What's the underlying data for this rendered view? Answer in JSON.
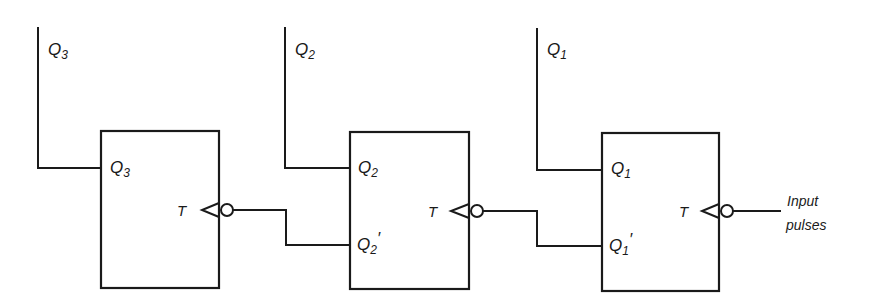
{
  "diagram": {
    "type": "ripple counter (3 T flip-flops)",
    "flipflops": [
      {
        "id": "ff3",
        "output_label": "Q",
        "output_sub": "3",
        "output_line_label": "Q",
        "output_line_sub": "3",
        "clock_label": "T",
        "has_complement_output": false
      },
      {
        "id": "ff2",
        "output_label": "Q",
        "output_sub": "2",
        "output_line_label": "Q",
        "output_line_sub": "2",
        "complement_label": "Q",
        "complement_sub": "2",
        "complement_mark": "′",
        "clock_label": "T",
        "has_complement_output": true
      },
      {
        "id": "ff1",
        "output_label": "Q",
        "output_sub": "1",
        "output_line_label": "Q",
        "output_line_sub": "1",
        "complement_label": "Q",
        "complement_sub": "1",
        "complement_mark": "′",
        "clock_label": "T",
        "has_complement_output": true
      }
    ],
    "input": {
      "line1": "Input",
      "line2": "pulses"
    },
    "connections": [
      "Q1' -> T of ff2",
      "Q2' -> T of ff3",
      "Input pulses -> T of ff1"
    ]
  }
}
